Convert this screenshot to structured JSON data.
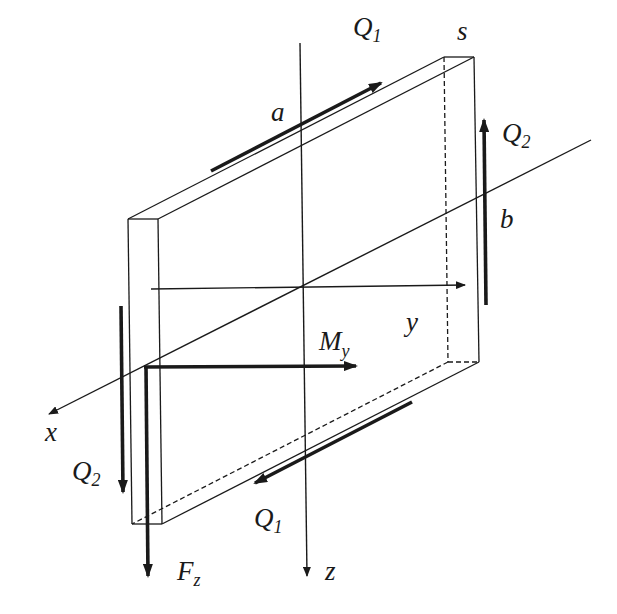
{
  "diagram": {
    "type": "3D plate element with internal forces",
    "colors": {
      "stroke": "#1a1a1a",
      "background": "#ffffff"
    },
    "labels": {
      "s": "s",
      "a": "a",
      "b": "b",
      "x": "x",
      "y": "y",
      "z": "z",
      "Q1_top": {
        "main": "Q",
        "sub": "1"
      },
      "Q1_bottom": {
        "main": "Q",
        "sub": "1"
      },
      "Q2_right": {
        "main": "Q",
        "sub": "2"
      },
      "Q2_left": {
        "main": "Q",
        "sub": "2"
      },
      "My": {
        "main": "M",
        "sub": "y"
      },
      "Fz": {
        "main": "F",
        "sub": "z"
      }
    },
    "axes": [
      {
        "name": "x",
        "direction": "diagonal, toward lower-left"
      },
      {
        "name": "y",
        "direction": "horizontal, toward right"
      },
      {
        "name": "z",
        "direction": "vertical, downward"
      }
    ],
    "forces": [
      {
        "name": "Q1",
        "location": "top edge",
        "direction": "up-right along edge"
      },
      {
        "name": "Q1",
        "location": "bottom edge",
        "direction": "down-left along edge"
      },
      {
        "name": "Q2",
        "location": "right edge",
        "direction": "upward"
      },
      {
        "name": "Q2",
        "location": "left edge",
        "direction": "downward"
      },
      {
        "name": "My",
        "location": "near left edge",
        "direction": "horizontal to right"
      },
      {
        "name": "Fz",
        "location": "near left edge",
        "direction": "downward"
      }
    ],
    "dimensions": [
      "a",
      "b",
      "s"
    ]
  }
}
